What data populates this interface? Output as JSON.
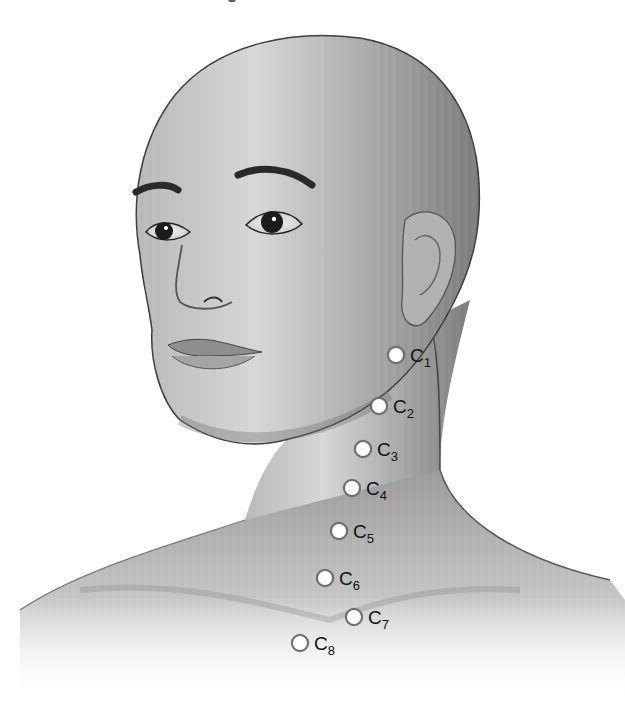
{
  "figure": {
    "colors": {
      "background": "#ffffff",
      "skin_light": "#d9d9d9",
      "skin_mid": "#a8a8a8",
      "skin_dark": "#6a6a6a",
      "outline": "#3a3a3a",
      "marker_fill": "#ffffff",
      "marker_ring": "#6e6e6e",
      "label_text": "#111111"
    },
    "markers": [
      {
        "id": "C1",
        "letter": "C",
        "num": "1",
        "x": 396,
        "y": 355,
        "lx": 410,
        "ly": 346
      },
      {
        "id": "C2",
        "letter": "C",
        "num": "2",
        "x": 379,
        "y": 406,
        "lx": 393,
        "ly": 397
      },
      {
        "id": "C3",
        "letter": "C",
        "num": "3",
        "x": 363,
        "y": 449,
        "lx": 377,
        "ly": 440
      },
      {
        "id": "C4",
        "letter": "C",
        "num": "4",
        "x": 352,
        "y": 488,
        "lx": 366,
        "ly": 479
      },
      {
        "id": "C5",
        "letter": "C",
        "num": "5",
        "x": 339,
        "y": 531,
        "lx": 353,
        "ly": 522
      },
      {
        "id": "C6",
        "letter": "C",
        "num": "6",
        "x": 325,
        "y": 578,
        "lx": 339,
        "ly": 569
      },
      {
        "id": "C7",
        "letter": "C",
        "num": "7",
        "x": 354,
        "y": 617,
        "lx": 368,
        "ly": 608
      },
      {
        "id": "C8",
        "letter": "C",
        "num": "8",
        "x": 300,
        "y": 643,
        "lx": 314,
        "ly": 634
      }
    ]
  }
}
